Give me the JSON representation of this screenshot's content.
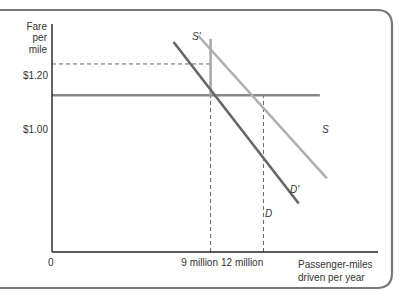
{
  "chart_data": {
    "type": "line",
    "title": "",
    "ylabel": "Fare per mile",
    "ylabel_lines": [
      "Fare",
      "per",
      "mile"
    ],
    "xlabel": "Passenger-miles driven per year",
    "xlabel_lines": [
      "Passenger-miles",
      "driven per year"
    ],
    "origin_label": "0",
    "y_ticks": [
      {
        "value": 1.2,
        "label": "$1.20"
      },
      {
        "value": 1.0,
        "label": "$1.00"
      }
    ],
    "x_ticks": [
      {
        "value": 9,
        "label": "9 million"
      },
      {
        "value": 12,
        "label": "12 million"
      }
    ],
    "xlim": [
      0,
      18.5
    ],
    "ylim": [
      0,
      1.455
    ],
    "series": [
      {
        "name": "S",
        "label": "S",
        "style": "horizontal",
        "color": "#888888",
        "points": [
          [
            0,
            1.0
          ],
          [
            15.2,
            1.0
          ]
        ]
      },
      {
        "name": "S'",
        "label": "S'",
        "style": "vertical",
        "color": "#aaaaaa",
        "points": [
          [
            9,
            1.0
          ],
          [
            9,
            1.36
          ]
        ]
      },
      {
        "name": "D",
        "label": "D",
        "style": "line",
        "color": "#666666",
        "points": [
          [
            6.9,
            1.34
          ],
          [
            14.0,
            0.31
          ]
        ]
      },
      {
        "name": "D'",
        "label": "D'",
        "style": "line",
        "color": "#b0b0b0",
        "points": [
          [
            8.3,
            1.38
          ],
          [
            15.6,
            0.47
          ]
        ]
      }
    ],
    "guides": [
      {
        "from": [
          0,
          1.2
        ],
        "to": [
          9,
          1.2
        ]
      },
      {
        "from": [
          9,
          0
        ],
        "to": [
          9,
          1.0
        ]
      },
      {
        "from": [
          12,
          0
        ],
        "to": [
          12,
          1.0
        ]
      }
    ],
    "grid": false,
    "legend": "none"
  }
}
